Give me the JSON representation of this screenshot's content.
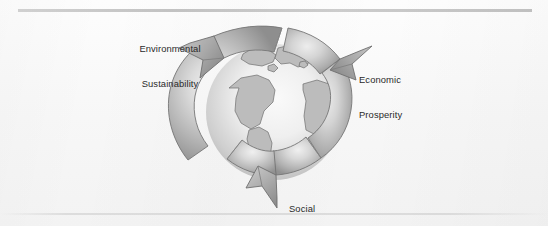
{
  "figure": {
    "name": "three-pillars-of-sustainability-recycling-globe",
    "background_color": "#fbfbfb",
    "ink_color": "#2a2a2a",
    "rule_color": "#bfbfbf"
  },
  "labels": {
    "environmental": {
      "line1": "Environmental",
      "line2": "Sustainability"
    },
    "economic": {
      "line1": "Economic",
      "line2": "Prosperity"
    },
    "social": {
      "line1": "Social",
      "line2": "Equity"
    }
  },
  "symbol": {
    "arrow_upper_left_name": "recycle-arrow-upper-left",
    "arrow_upper_right_name": "recycle-arrow-upper-right",
    "arrow_lower_name": "recycle-arrow-lower",
    "globe_name": "globe-earth",
    "band_fill_light": "#e2e2e2",
    "band_fill_mid": "#b9b9b9",
    "band_fill_dark": "#8f8f8f",
    "globe_fill_light": "#f2f2f2",
    "globe_fill_mid": "#c9c9c9",
    "outline_color": "#7a7a7a"
  }
}
